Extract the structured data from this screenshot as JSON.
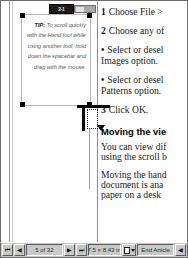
{
  "application": {
    "kind": "desktop-publishing-layout-view"
  },
  "frame_badge": {
    "label": "2-1"
  },
  "tip_callout": {
    "label": "TIP:",
    "text": "To scroll quickly with the Hand tool while using another tool, hold down the spacebar and drag with the mouse."
  },
  "article": {
    "steps": [
      {
        "num": "1",
        "text": "Choose File >"
      },
      {
        "num": "2",
        "text": "Choose any of"
      }
    ],
    "bullets": [
      {
        "dot": "•",
        "text": "Select or desel",
        "cont": "Images option."
      },
      {
        "dot": "•",
        "text": "Select or desel",
        "cont": "Patterns option."
      }
    ],
    "final_step": {
      "num": "3",
      "text": "Click OK."
    },
    "heading": "Moving the vie",
    "paragraphs": [
      [
        "You can view dif",
        "using the scroll b"
      ],
      [
        "Moving the hand",
        "document is ana",
        "paper on a desk"
      ]
    ]
  },
  "statusbar": {
    "first_page_label": "⏮",
    "prev_page_label": "◀",
    "next_page_label": "▶",
    "last_page_label": "⏭",
    "page_indicator": "5 of 32",
    "page_size": "7.5 × 8.43 in",
    "page_icon_name": "page-master-icon",
    "article_name": "End Article",
    "article_prev_label": "◀"
  },
  "colors": {
    "chrome": "#c8c8c4",
    "canvas": "#ffffff",
    "handle": "#000000",
    "badge": "#1c1c1c",
    "guide": "#9c9c9c",
    "text": "#1a1a1a",
    "tip_text": "#585858"
  }
}
